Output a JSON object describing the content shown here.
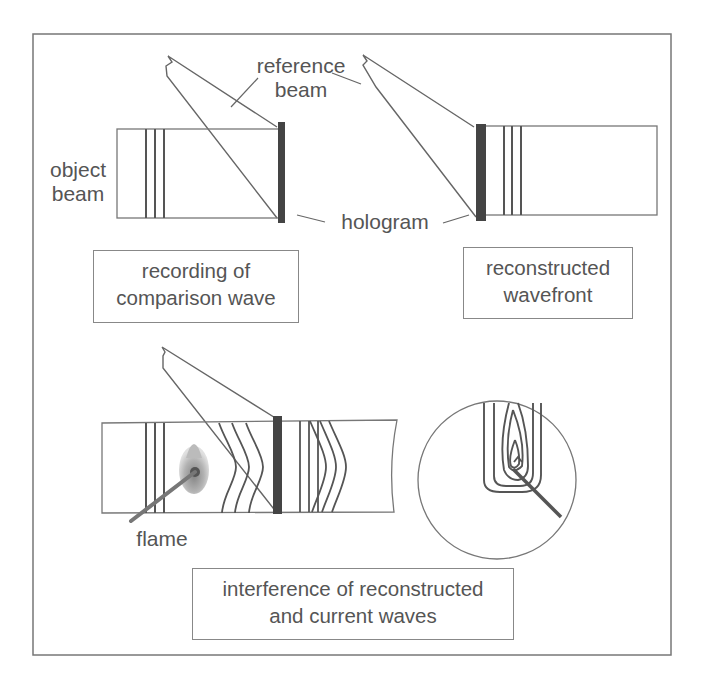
{
  "diagram": {
    "colors": {
      "line": "#666666",
      "hologram": "#444444",
      "text": "#555555",
      "flame": "#999999"
    },
    "labels": {
      "reference_beam": "reference\nbeam",
      "reference_line1": "reference",
      "reference_line2": "beam",
      "object_line1": "object",
      "object_line2": "beam",
      "hologram": "hologram",
      "flame": "flame"
    },
    "panels": [
      {
        "id": "recording",
        "caption_line1": "recording of",
        "caption_line2": "comparison wave"
      },
      {
        "id": "reconstruction",
        "caption_line1": "reconstructed",
        "caption_line2": "wavefront"
      },
      {
        "id": "interference",
        "caption_line1": "interference of reconstructed",
        "caption_line2": "and current waves"
      }
    ]
  }
}
